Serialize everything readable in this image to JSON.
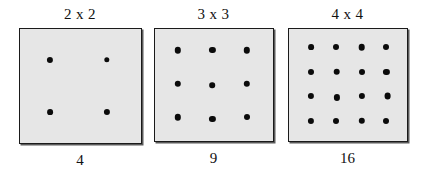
{
  "figure": {
    "background_color": "#ffffff",
    "box_fill_color": "#e6e6e6",
    "box_border_color": "#1a1a1a",
    "dot_color": "#0b0b0b",
    "text_color": "#111111"
  },
  "chart_data": {
    "type": "diagram",
    "title": "",
    "subtitle": "",
    "xlabel": "",
    "ylabel": "",
    "categories": [
      "2 x 2",
      "3 x 3",
      "4 x 4"
    ],
    "values": [
      4,
      9,
      16
    ],
    "series": [
      {
        "name": "dot count",
        "values": [
          4,
          9,
          16
        ]
      },
      {
        "name": "rows",
        "values": [
          2,
          3,
          4
        ]
      },
      {
        "name": "columns",
        "values": [
          2,
          3,
          4
        ]
      }
    ],
    "legend": [],
    "grid": false
  },
  "panels": [
    {
      "title": "2 x 2",
      "caption": "4",
      "rows": 2,
      "cols": 4,
      "dots": [
        {
          "cx": 25,
          "cy": 27,
          "d": 6.2
        },
        {
          "cx": 72,
          "cy": 27,
          "d": 5.4
        },
        {
          "cx": 25,
          "cy": 73,
          "d": 5.8
        },
        {
          "cx": 72,
          "cy": 73,
          "d": 6.2
        }
      ]
    },
    {
      "title": "3 x 3",
      "caption": "9",
      "rows": 3,
      "cols": 3,
      "dots": [
        {
          "cx": 20,
          "cy": 19,
          "d": 6.4
        },
        {
          "cx": 49,
          "cy": 19,
          "d": 6.2
        },
        {
          "cx": 78,
          "cy": 19,
          "d": 6.4
        },
        {
          "cx": 20,
          "cy": 49,
          "d": 6.4
        },
        {
          "cx": 49,
          "cy": 50,
          "d": 5.6
        },
        {
          "cx": 78,
          "cy": 49,
          "d": 6.4
        },
        {
          "cx": 20,
          "cy": 79,
          "d": 6.4
        },
        {
          "cx": 49,
          "cy": 80,
          "d": 6.2
        },
        {
          "cx": 78,
          "cy": 79,
          "d": 6.0
        }
      ]
    },
    {
      "title": "4 x 4",
      "caption": "16",
      "rows": 4,
      "cols": 4,
      "dots": [
        {
          "cx": 19,
          "cy": 16,
          "d": 5.8
        },
        {
          "cx": 40,
          "cy": 16,
          "d": 6.0
        },
        {
          "cx": 62,
          "cy": 16,
          "d": 6.6
        },
        {
          "cx": 83,
          "cy": 16,
          "d": 6.0
        },
        {
          "cx": 19,
          "cy": 38,
          "d": 6.0
        },
        {
          "cx": 41,
          "cy": 38,
          "d": 6.6
        },
        {
          "cx": 62,
          "cy": 38,
          "d": 6.0
        },
        {
          "cx": 83,
          "cy": 38,
          "d": 6.2
        },
        {
          "cx": 19,
          "cy": 60,
          "d": 6.2
        },
        {
          "cx": 41,
          "cy": 61,
          "d": 6.2
        },
        {
          "cx": 62,
          "cy": 60,
          "d": 6.2
        },
        {
          "cx": 84,
          "cy": 60,
          "d": 6.8
        },
        {
          "cx": 19,
          "cy": 82,
          "d": 6.2
        },
        {
          "cx": 40,
          "cy": 82,
          "d": 6.0
        },
        {
          "cx": 62,
          "cy": 82,
          "d": 6.4
        },
        {
          "cx": 83,
          "cy": 82,
          "d": 6.0
        }
      ]
    }
  ]
}
